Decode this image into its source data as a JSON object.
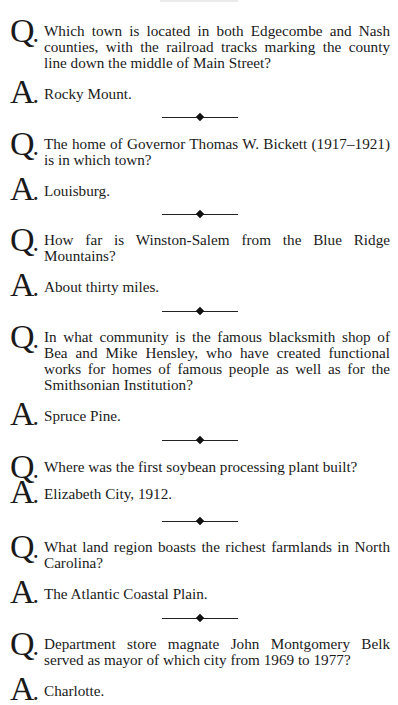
{
  "page": {
    "qa_items": [
      {
        "q_label": "Q",
        "question": "Which town is located in both Edgecombe and Nash counties, with the railroad tracks marking the county line down the middle of Main Street?",
        "a_label": "A",
        "answer": "Rocky Mount."
      },
      {
        "q_label": "Q",
        "question": "The home of Governor Thomas W. Bickett (1917–1921) is in which town?",
        "a_label": "A",
        "answer": "Louisburg."
      },
      {
        "q_label": "Q",
        "question": "How far is Winston-Salem from the Blue Ridge Mountains?",
        "a_label": "A",
        "answer": "About thirty miles."
      },
      {
        "q_label": "Q",
        "question": "In what community is the famous blacksmith shop of Bea and Mike Hensley, who have created functional works for homes of famous people as well as for the Smithsonian Institution?",
        "a_label": "A",
        "answer": "Spruce Pine."
      },
      {
        "q_label": "Q",
        "question": "Where was the first soybean processing plant built?",
        "a_label": "A",
        "answer": "Elizabeth City, 1912."
      },
      {
        "q_label": "Q",
        "question": "What land region boasts the richest farmlands in North Carolina?",
        "a_label": "A",
        "answer": "The Atlantic Coastal Plain."
      },
      {
        "q_label": "Q",
        "question": "Department store magnate John Montgomery Belk served as mayor of which city from 1969 to 1977?",
        "a_label": "A",
        "answer": "Charlotte."
      }
    ]
  }
}
